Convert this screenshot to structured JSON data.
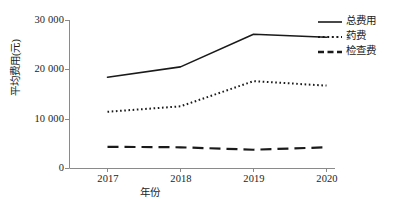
{
  "chart_data": {
    "type": "line",
    "title": "",
    "xlabel": "年份",
    "ylabel": "平均费用(元)",
    "categories": [
      "2017",
      "2018",
      "2019",
      "2020"
    ],
    "x": [
      2017,
      2018,
      2019,
      2020
    ],
    "ylim": [
      0,
      30000
    ],
    "xlim": [
      2016.6,
      2020.4
    ],
    "yticks": [
      "0",
      "10 000",
      "20 000",
      "30 000"
    ],
    "ytick_values": [
      0,
      10000,
      20000,
      30000
    ],
    "grid": false,
    "legend_position": "right",
    "series": [
      {
        "name": "总费用",
        "style": "solid",
        "color": "#1a1a1a",
        "values": [
          18500,
          20600,
          27200,
          26600
        ]
      },
      {
        "name": "药费",
        "style": "dotted",
        "color": "#1a1a1a",
        "values": [
          11500,
          12600,
          17700,
          16800
        ]
      },
      {
        "name": "检查费",
        "style": "dashed",
        "color": "#1a1a1a",
        "values": [
          4400,
          4300,
          3800,
          4300
        ]
      }
    ]
  },
  "axes": {
    "y_title": "平均费用(元)",
    "x_title": "年份",
    "y_ticks": [
      {
        "label": "30 000",
        "value": 30000
      },
      {
        "label": "20 000",
        "value": 20000
      },
      {
        "label": "10 000",
        "value": 10000
      },
      {
        "label": "0",
        "value": 0
      }
    ],
    "x_ticks": [
      {
        "label": "2017",
        "value": 2017
      },
      {
        "label": "2018",
        "value": 2018
      },
      {
        "label": "2019",
        "value": 2019
      },
      {
        "label": "2020",
        "value": 2020
      }
    ]
  },
  "legend": {
    "items": [
      {
        "label": "总费用",
        "style": "solid"
      },
      {
        "label": "药费",
        "style": "dotted"
      },
      {
        "label": "检查费",
        "style": "dashed"
      }
    ]
  },
  "colors": {
    "axis": "#8a8a8a",
    "ink": "#1a1a1a",
    "background": "#ffffff"
  }
}
